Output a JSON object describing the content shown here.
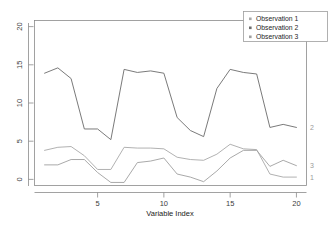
{
  "chart_data": {
    "type": "line",
    "title": "",
    "subtitle": "",
    "xlabel": "Variable Index",
    "ylabel": "",
    "xlim": [
      1,
      20
    ],
    "ylim": [
      0,
      20
    ],
    "grid": false,
    "legend_position": "top-right",
    "x": [
      1,
      2,
      3,
      4,
      5,
      6,
      7,
      8,
      9,
      10,
      11,
      12,
      13,
      14,
      15,
      16,
      17,
      18,
      19,
      20
    ],
    "xticks": [
      5,
      10,
      15,
      20
    ],
    "xticklabels": [
      "5",
      "10",
      "15",
      "20"
    ],
    "yticks": [
      0,
      5,
      10,
      15,
      20
    ],
    "yticklabels": [
      "0",
      "5",
      "10",
      "15",
      "20"
    ],
    "series": [
      {
        "name": "Observation 1",
        "end_label": "1",
        "color": "#a8a8a8",
        "marker": "square",
        "values": [
          3.8,
          4.2,
          4.3,
          3.1,
          1.3,
          1.3,
          4.2,
          4.1,
          4.1,
          4.0,
          2.9,
          2.6,
          2.5,
          3.3,
          4.6,
          4.0,
          3.9,
          0.7,
          0.3,
          0.3
        ]
      },
      {
        "name": "Observation 2",
        "end_label": "2",
        "color": "#6b6b6b",
        "marker": "square",
        "values": [
          13.9,
          14.6,
          13.2,
          6.6,
          6.6,
          5.2,
          14.4,
          14.0,
          14.2,
          13.9,
          8.1,
          6.4,
          5.6,
          11.9,
          14.4,
          14.0,
          13.8,
          6.8,
          7.2,
          6.8
        ]
      },
      {
        "name": "Observation 3",
        "end_label": "3",
        "color": "#9f9f9f",
        "marker": "square",
        "values": [
          1.9,
          1.9,
          2.6,
          2.6,
          0.9,
          -0.4,
          -0.4,
          2.2,
          2.4,
          2.8,
          0.7,
          0.3,
          -0.3,
          1.1,
          2.8,
          3.8,
          3.8,
          1.7,
          2.5,
          1.8
        ]
      }
    ]
  },
  "legend": {
    "entries": [
      {
        "label": "Observation 1"
      },
      {
        "label": "Observation 2"
      },
      {
        "label": "Observation 3"
      }
    ]
  },
  "axes": {
    "x_label": "Variable Index"
  }
}
